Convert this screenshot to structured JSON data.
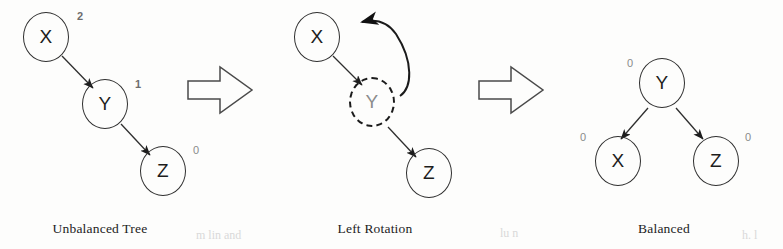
{
  "figure": {
    "background": "#fdfdfc",
    "stroke_color": "#2e2e2e",
    "label_color": "#6d6d6d"
  },
  "panels": [
    {
      "id": "unbalanced",
      "caption": "Unbalanced Tree",
      "nodes": [
        {
          "id": "x",
          "label": "X",
          "balance_factor": "2",
          "bf_position": "top-right",
          "style": "solid"
        },
        {
          "id": "y",
          "label": "Y",
          "balance_factor": "1",
          "bf_position": "top-right",
          "style": "solid"
        },
        {
          "id": "z",
          "label": "Z",
          "balance_factor": "0",
          "bf_position": "top-right",
          "style": "solid"
        }
      ],
      "edges": [
        {
          "from": "x",
          "to": "y",
          "arrow": true
        },
        {
          "from": "y",
          "to": "z",
          "arrow": true
        }
      ]
    },
    {
      "id": "rotation",
      "caption": "Left Rotation",
      "nodes": [
        {
          "id": "x",
          "label": "X",
          "balance_factor": "",
          "bf_position": "none",
          "style": "solid"
        },
        {
          "id": "y",
          "label": "Y",
          "balance_factor": "",
          "bf_position": "none",
          "style": "dashed"
        },
        {
          "id": "z",
          "label": "Z",
          "balance_factor": "",
          "bf_position": "none",
          "style": "solid"
        }
      ],
      "edges": [
        {
          "from": "x",
          "to": "y",
          "arrow": true
        },
        {
          "from": "y",
          "to": "z",
          "arrow": true
        }
      ],
      "rotation_arrow": {
        "from": "y",
        "to": "x",
        "direction": "counter-clockwise",
        "style": "curved"
      }
    },
    {
      "id": "balanced",
      "caption": "Balanced",
      "nodes": [
        {
          "id": "y",
          "label": "Y",
          "balance_factor": "0",
          "bf_position": "top-left",
          "style": "solid"
        },
        {
          "id": "x",
          "label": "X",
          "balance_factor": "0",
          "bf_position": "top-left",
          "style": "solid"
        },
        {
          "id": "z",
          "label": "Z",
          "balance_factor": "0",
          "bf_position": "top-right",
          "style": "solid"
        }
      ],
      "edges": [
        {
          "from": "y",
          "to": "x",
          "arrow": true
        },
        {
          "from": "y",
          "to": "z",
          "arrow": true
        }
      ]
    }
  ],
  "transitions": [
    {
      "id": "arrow-1",
      "shape": "block-arrow-right"
    },
    {
      "id": "arrow-2",
      "shape": "block-arrow-right"
    }
  ],
  "scan_artifacts": [
    {
      "text": "m lin  and",
      "x": 196,
      "y": 228
    },
    {
      "text": "lu n",
      "x": 500,
      "y": 226
    },
    {
      "text": "h. l",
      "x": 742,
      "y": 228
    }
  ]
}
